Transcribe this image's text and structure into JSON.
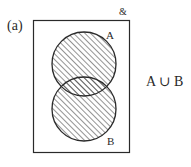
{
  "figure": {
    "label": "(a)",
    "universal_set_symbol": "&",
    "operation": "A ∪ B",
    "sets": [
      {
        "name": "A",
        "label": "A",
        "shaded": true
      },
      {
        "name": "B",
        "label": "B",
        "shaded": true
      }
    ],
    "shading": "diagonal hatch (union of A and B)",
    "colors": {
      "stroke": "#2a2a2a",
      "hatch": "#3a3a3a",
      "background": "#ffffff"
    }
  }
}
